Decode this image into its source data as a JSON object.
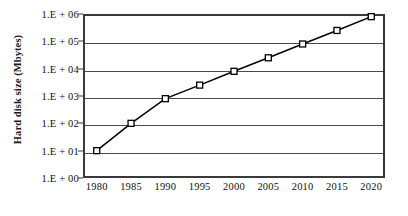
{
  "chart_data": {
    "type": "line",
    "title": "",
    "xlabel": "",
    "ylabel": "Hard disk size (Mbytes)",
    "x": [
      1980,
      1985,
      1990,
      1995,
      2000,
      2005,
      2010,
      2015,
      2020
    ],
    "xtick_labels": [
      "1980",
      "1985",
      "1990",
      "1995",
      "2000",
      "2005",
      "2010",
      "2015",
      "2020"
    ],
    "values": [
      10,
      100,
      800,
      2500,
      8000,
      25000,
      80000,
      250000,
      800000
    ],
    "yscale": "log",
    "ylim": [
      1,
      1000000
    ],
    "xlim": [
      1978,
      2022
    ],
    "ytick_values": [
      1000000,
      100000,
      10000,
      1000,
      100,
      10,
      1
    ],
    "ytick_labels": [
      "1.E + 06",
      "1.E + 05",
      "1.E + 04",
      "1.E + 03",
      "1.E + 02",
      "1.E + 01",
      "1.E + 00"
    ],
    "grid": "horizontal",
    "legend": "none",
    "marker": "open-square",
    "line_color": "#000000",
    "grid_color": "#4a4a4a",
    "background_color": "#ffffff"
  }
}
